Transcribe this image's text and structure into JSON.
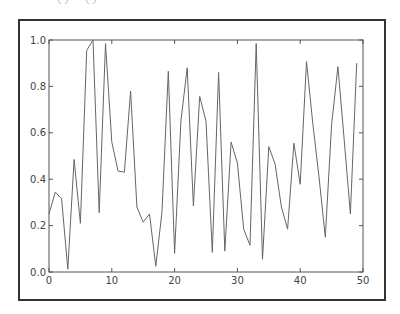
{
  "chart_data": {
    "type": "line",
    "title": "",
    "xlabel": "",
    "ylabel": "",
    "xlim": [
      0,
      50
    ],
    "ylim": [
      0.0,
      1.0
    ],
    "grid": false,
    "legend": null,
    "x_ticks": [
      "0",
      "10",
      "20",
      "30",
      "40",
      "50"
    ],
    "y_ticks": [
      "0.0",
      "0.2",
      "0.4",
      "0.6",
      "0.8",
      "1.0"
    ],
    "line_color": "#666666",
    "series": [
      {
        "name": "series-1",
        "x": [
          0,
          1,
          2,
          3,
          4,
          5,
          6,
          7,
          8,
          9,
          10,
          11,
          12,
          13,
          14,
          15,
          16,
          17,
          18,
          19,
          20,
          21,
          22,
          23,
          24,
          25,
          26,
          27,
          28,
          29,
          30,
          31,
          32,
          33,
          34,
          35,
          36,
          37,
          38,
          39,
          40,
          41,
          42,
          43,
          44,
          45,
          46,
          47,
          48,
          49
        ],
        "values": [
          0.25,
          0.345,
          0.315,
          0.012,
          0.485,
          0.21,
          0.955,
          1.0,
          0.255,
          0.985,
          0.56,
          0.435,
          0.43,
          0.78,
          0.28,
          0.215,
          0.25,
          0.025,
          0.26,
          0.865,
          0.08,
          0.65,
          0.88,
          0.285,
          0.757,
          0.65,
          0.085,
          0.86,
          0.09,
          0.56,
          0.47,
          0.185,
          0.115,
          0.985,
          0.055,
          0.54,
          0.465,
          0.28,
          0.185,
          0.555,
          0.378,
          0.907,
          0.64,
          0.41,
          0.15,
          0.635,
          0.885,
          0.57,
          0.25,
          0.9
        ]
      }
    ]
  },
  "colors": {
    "frame": "#333333",
    "axes": "#555555",
    "line": "#666666"
  }
}
